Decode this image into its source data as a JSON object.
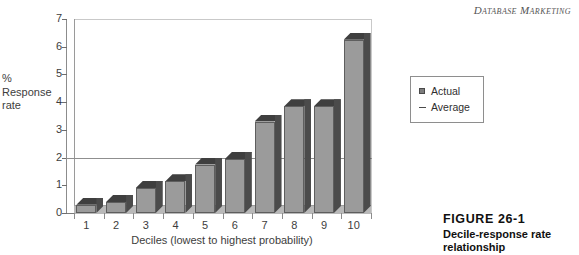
{
  "running_head": "Database Marketing",
  "figure": {
    "number": "FIGURE 26-1",
    "title": "Decile-response rate\nrelationship"
  },
  "legend": {
    "items": [
      {
        "label": "Actual",
        "marker": "square-swatch-icon"
      },
      {
        "label": "Average",
        "marker": "line-swatch-icon"
      }
    ]
  },
  "chart_data": {
    "type": "bar",
    "title": "",
    "xlabel": "Deciles (lowest to highest probability)",
    "ylabel": "%\nResponse\nrate",
    "categories": [
      "1",
      "2",
      "3",
      "4",
      "5",
      "6",
      "7",
      "8",
      "9",
      "10"
    ],
    "values": [
      0.3,
      0.4,
      0.9,
      1.15,
      1.75,
      1.95,
      3.3,
      3.85,
      3.85,
      6.25
    ],
    "series": [
      {
        "name": "Actual",
        "values": [
          0.3,
          0.4,
          0.9,
          1.15,
          1.75,
          1.95,
          3.3,
          3.85,
          3.85,
          6.25
        ]
      }
    ],
    "reference_lines": [
      {
        "name": "Average",
        "value": 2
      }
    ],
    "ylim": [
      0,
      7
    ],
    "yticks": [
      0,
      1,
      2,
      3,
      4,
      5,
      6,
      7
    ],
    "ytick_labels": [
      "0",
      "1",
      "2",
      "3",
      "4",
      "5",
      "6",
      "7"
    ],
    "grid": false,
    "legend_position": "right"
  }
}
